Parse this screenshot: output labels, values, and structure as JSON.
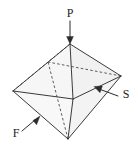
{
  "figure": {
    "shape": "octahedron",
    "background_color": "#ffffff",
    "edge_color": "#3a3a3a",
    "hidden_edge_color": "#4a4a4a",
    "label_color": "#1d1d1d",
    "face_tint": "#f4f4f4"
  },
  "labels": {
    "p": {
      "text": "P",
      "meaning": "pinacoid-apex-label",
      "x": 70,
      "y": 14
    },
    "s": {
      "text": "S",
      "meaning": "side-face-label",
      "x": 126,
      "y": 95
    },
    "f": {
      "text": "F",
      "meaning": "front-face-label",
      "x": 16,
      "y": 134
    }
  },
  "leaders": {
    "p": {
      "name": "p-leader-arrow",
      "from_x": 70,
      "from_y": 21,
      "to_x": 70,
      "to_y": 43,
      "direction": "down"
    },
    "s": {
      "name": "s-leader-arrow",
      "from_x": 118,
      "from_y": 96,
      "to_x": 95,
      "to_y": 87,
      "direction": "up-left"
    },
    "f": {
      "name": "f-leader-arrow",
      "from_x": 22,
      "from_y": 131,
      "to_x": 39,
      "to_y": 117,
      "direction": "up-right"
    }
  },
  "vertices": {
    "top": {
      "name": "apex-top-vertex",
      "x": 70,
      "y": 44
    },
    "bottom": {
      "name": "apex-bottom-vertex",
      "x": 68,
      "y": 139
    },
    "left": {
      "name": "left-equatorial-vertex",
      "x": 13,
      "y": 91
    },
    "right": {
      "name": "right-equatorial-vertex",
      "x": 121,
      "y": 76
    },
    "front": {
      "name": "front-equatorial-vertex",
      "x": 73,
      "y": 99
    },
    "back": {
      "name": "back-equatorial-vertex-hidden",
      "x": 48,
      "y": 62
    }
  },
  "edges": {
    "visible": [
      "top-left",
      "top-right",
      "top-front",
      "left-front",
      "right-front",
      "left-right-upper",
      "bottom-left",
      "bottom-right",
      "bottom-front"
    ],
    "hidden": [
      "top-back",
      "left-back",
      "right-back",
      "bottom-back"
    ]
  }
}
